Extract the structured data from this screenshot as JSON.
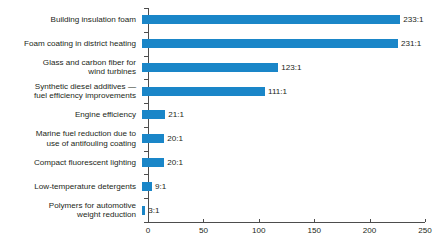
{
  "chart_data": {
    "type": "bar",
    "orientation": "horizontal",
    "title": "",
    "subtitle": "",
    "xlabel": "",
    "ylabel": "",
    "xlim": [
      0,
      250
    ],
    "xticks": [
      0,
      50,
      100,
      150,
      200,
      250
    ],
    "xtick_labels": [
      "0",
      "50",
      "100",
      "150",
      "200",
      "250"
    ],
    "grid": false,
    "legend": null,
    "bar_color": "#1a86c8",
    "text_color": "#231f20",
    "axis_color": "#4d4d4d",
    "categories": [
      "Building insulation foam",
      "Foam coating in district heating",
      "Glass and carbon fiber for\nwind turbines",
      "Synthetic diesel additives —\nfuel efficiency improvements",
      "Engine efficiency",
      "Marine fuel reduction due to\nuse of antifouling coating",
      "Compact fluorescent lighting",
      "Low-temperature detergents",
      "Polymers for automotive\nweight reduction"
    ],
    "values": [
      233,
      231,
      123,
      111,
      21,
      20,
      20,
      9,
      3
    ],
    "value_labels": [
      "233:1",
      "231:1",
      "123:1",
      "111:1",
      "21:1",
      "20:1",
      "20:1",
      "9:1",
      "3:1"
    ]
  }
}
